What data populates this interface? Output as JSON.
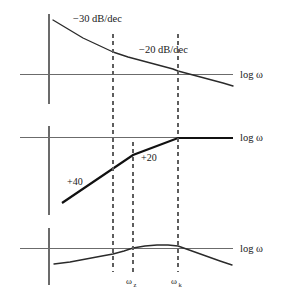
{
  "figure": {
    "background_color": "#ffffff",
    "curve_color": "#2a2a2a",
    "axis_color": "#6b6b6b",
    "dashed_color": "#5d5d5d"
  },
  "labels": {
    "axis_log_omega": "log ω",
    "slope_minus30": "−30 dB/dec",
    "slope_minus20": "−20 dB/dec",
    "gain_plus40": "+40",
    "gain_plus20": "+20",
    "omega_z_base": "ω",
    "omega_z_sub": "z",
    "omega_k_base": "ω",
    "omega_k_sub": "k"
  },
  "chart_data": [
    {
      "type": "line",
      "name": "panel-top",
      "title": "",
      "xlabel": "log ω",
      "ylabel": "",
      "grid": false,
      "legend": "none",
      "annotations": [
        "−30 dB/dec",
        "−20 dB/dec"
      ],
      "vertical_markers": [
        113,
        133,
        178
      ],
      "x_axis_y": 74,
      "y_axis_x": 49,
      "series": [
        {
          "name": "magnitude",
          "points": [
            [
              53,
              20
            ],
            [
              68,
              29
            ],
            [
              83,
              38
            ],
            [
              98,
              45
            ],
            [
              113,
              52
            ],
            [
              128,
              57
            ],
            [
              143,
              61
            ],
            [
              158,
              65
            ],
            [
              173,
              69
            ],
            [
              178,
              71
            ],
            [
              193,
              75
            ],
            [
              208,
              79
            ],
            [
              223,
              83
            ],
            [
              233,
              86
            ]
          ]
        }
      ]
    },
    {
      "type": "line",
      "name": "panel-middle",
      "title": "",
      "xlabel": "log ω",
      "ylabel": "",
      "grid": false,
      "legend": "none",
      "annotations": [
        "+40",
        "+20"
      ],
      "vertical_markers": [
        113,
        133,
        178
      ],
      "x_axis_y": 137,
      "y_axis_x": 49,
      "series": [
        {
          "name": "asymptote",
          "points": [
            [
              62,
              203
            ],
            [
              133,
              155
            ],
            [
              178,
              138
            ],
            [
              233,
              138
            ]
          ]
        }
      ]
    },
    {
      "type": "line",
      "name": "panel-bottom",
      "title": "",
      "xlabel": "log ω",
      "ylabel": "",
      "grid": false,
      "legend": "none",
      "annotations": [
        "ω_z",
        "ω_k"
      ],
      "vertical_markers": [
        113,
        133,
        178
      ],
      "x_axis_y": 248,
      "y_axis_x": 49,
      "series": [
        {
          "name": "response",
          "points": [
            [
              54,
              264
            ],
            [
              70,
              262
            ],
            [
              86,
              259
            ],
            [
              102,
              256
            ],
            [
              113,
              254
            ],
            [
              124,
              251
            ],
            [
              133,
              248
            ],
            [
              145,
              246
            ],
            [
              157,
              245
            ],
            [
              168,
              245
            ],
            [
              178,
              246
            ],
            [
              192,
              251
            ],
            [
              206,
              256
            ],
            [
              220,
              261
            ],
            [
              232,
              265
            ]
          ]
        }
      ]
    }
  ],
  "tick_labels": [
    {
      "x": 133,
      "y": 283,
      "base": "ω",
      "sub": "z"
    },
    {
      "x": 178,
      "y": 283,
      "base": "ω",
      "sub": "k"
    }
  ]
}
